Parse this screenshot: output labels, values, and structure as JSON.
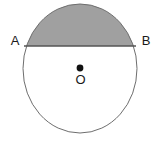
{
  "figure": {
    "canvas": {
      "width": 162,
      "height": 142,
      "background": "#ffffff"
    },
    "colors": {
      "shaded_segment_fill": "#a0a0a0",
      "circle_stroke": "#6e6e6e",
      "chord_stroke": "#555555",
      "center_dot_fill": "#111111",
      "label_color": "#1a1a1a",
      "circle_fill": "#ffffff"
    },
    "circle": {
      "center_x": 80,
      "center_y": 68.5,
      "radius_x": 57,
      "radius_y": 64.5,
      "stroke_width": 1
    },
    "chord": {
      "name": "AB",
      "y": 46,
      "x_start": 24,
      "x_end": 136,
      "stroke_width": 1.6
    },
    "center_point": {
      "x": 80,
      "y": 68,
      "radius": 3.4
    },
    "labels": {
      "point_a": {
        "text": "A",
        "x": 15,
        "y": 42
      },
      "point_b": {
        "text": "B",
        "x": 146,
        "y": 42
      },
      "center_o": {
        "text": "O",
        "x": 80.5,
        "y": 81
      }
    }
  }
}
